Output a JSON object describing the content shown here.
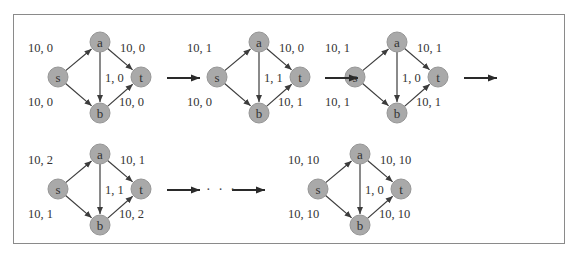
{
  "colors": {
    "node_fill": "#a9a9a9",
    "node_stroke": "#969696",
    "edge": "#3c3c3c",
    "arrow": "#2a2a2a",
    "frame": "#8a8a8a",
    "text": "#333333"
  },
  "nodes": [
    "s",
    "a",
    "b",
    "t"
  ],
  "graphs": [
    {
      "id": "step-1",
      "dx": 0,
      "dy": 0,
      "labels": {
        "sa": "10, 0",
        "sb": "10, 0",
        "ab": "1, 0",
        "at": "10, 0",
        "bt": "10, 0"
      }
    },
    {
      "id": "step-2",
      "dx": 159,
      "dy": 0,
      "labels": {
        "sa": "10, 1",
        "sb": "10, 0",
        "ab": "1, 1",
        "at": "10, 0",
        "bt": "10, 1"
      }
    },
    {
      "id": "step-3",
      "dx": 297,
      "dy": 0,
      "labels": {
        "sa": "10, 1",
        "sb": "10, 1",
        "ab": "1, 0",
        "at": "10, 1",
        "bt": "10, 1"
      }
    },
    {
      "id": "step-4",
      "dx": 0,
      "dy": 112,
      "labels": {
        "sa": "10, 2",
        "sb": "10, 1",
        "ab": "1, 1",
        "at": "10, 1",
        "bt": "10, 2"
      }
    },
    {
      "id": "final",
      "dx": 260,
      "dy": 112,
      "labels": {
        "sa": "10, 10",
        "sb": "10, 10",
        "ab": "1, 0",
        "at": "10, 10",
        "bt": "10, 10"
      }
    }
  ],
  "transitions": [
    {
      "x1": 167,
      "y1": 78,
      "x2": 200,
      "y2": 78
    },
    {
      "x1": 325,
      "y1": 78,
      "x2": 358,
      "y2": 78
    },
    {
      "x1": 464,
      "y1": 78,
      "x2": 497,
      "y2": 78
    },
    {
      "x1": 167,
      "y1": 190,
      "x2": 200,
      "y2": 190
    },
    {
      "x1": 232,
      "y1": 190,
      "x2": 265,
      "y2": 190
    }
  ],
  "ellipsis": {
    "text": "· · ·",
    "x": 206,
    "y": 194
  }
}
